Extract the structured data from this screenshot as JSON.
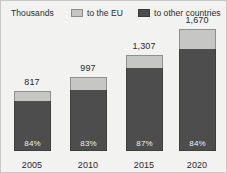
{
  "header": {
    "units_label": "Thousands",
    "legend": [
      {
        "key": "eu",
        "label": "to the EU",
        "color": "#c6c6c4"
      },
      {
        "key": "other",
        "label": "to other countries",
        "color": "#4d4d4d"
      }
    ]
  },
  "colors": {
    "background": "#f2f2f0",
    "eu_segment": "#c6c6c4",
    "other_segment": "#4d4d4d",
    "text": "#2b2b2b",
    "pct_text": "#f0f0ee"
  },
  "chart_data": {
    "type": "bar",
    "title": "",
    "subtitle": "",
    "xlabel": "",
    "ylabel": "Thousands",
    "stacked": true,
    "grid": false,
    "legend_position": "top",
    "ylim": [
      0,
      1670
    ],
    "categories": [
      "2005",
      "2010",
      "2015",
      "2020"
    ],
    "totals": [
      817,
      997,
      1307,
      1670
    ],
    "total_labels": [
      "817",
      "997",
      "1,307",
      "1,670"
    ],
    "pct_labels": [
      "84%",
      "83%",
      "87%",
      "84%"
    ],
    "series": [
      {
        "name": "to other countries",
        "color": "#4d4d4d",
        "values": [
          686,
          828,
          1137,
          1403
        ],
        "percent": [
          84,
          83,
          87,
          84
        ]
      },
      {
        "name": "to the EU",
        "color": "#c6c6c4",
        "values": [
          131,
          169,
          170,
          267
        ],
        "percent": [
          16,
          17,
          13,
          16
        ]
      }
    ]
  },
  "bars": [
    {
      "year": "2005",
      "total_label": "817",
      "pct_label": "84%",
      "other_px": 50,
      "eu_px": 10,
      "label_top_px": 60,
      "left_px": 4
    },
    {
      "year": "2010",
      "total_label": "997",
      "pct_label": "83%",
      "other_px": 61,
      "eu_px": 13,
      "label_top_px": 46,
      "left_px": 60
    },
    {
      "year": "2015",
      "total_label": "1,307",
      "pct_label": "87%",
      "other_px": 83,
      "eu_px": 13,
      "label_top_px": 23,
      "left_px": 116
    },
    {
      "year": "2020",
      "total_label": "1,670",
      "pct_label": "84%",
      "other_px": 102,
      "eu_px": 20,
      "label_top_px": -3,
      "left_px": 169
    }
  ]
}
